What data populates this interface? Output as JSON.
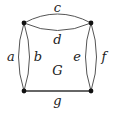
{
  "graph": {
    "name": "G",
    "vertices": [
      {
        "id": "v1",
        "x": 24,
        "y": 23
      },
      {
        "id": "v2",
        "x": 91,
        "y": 23
      },
      {
        "id": "v3",
        "x": 24,
        "y": 91
      },
      {
        "id": "v4",
        "x": 91,
        "y": 91
      }
    ],
    "edges": [
      {
        "label": "a",
        "from": "v1",
        "to": "v3"
      },
      {
        "label": "b",
        "from": "v1",
        "to": "v3"
      },
      {
        "label": "c",
        "from": "v1",
        "to": "v2"
      },
      {
        "label": "d",
        "from": "v1",
        "to": "v2"
      },
      {
        "label": "e",
        "from": "v2",
        "to": "v4"
      },
      {
        "label": "f",
        "from": "v2",
        "to": "v4"
      },
      {
        "label": "g",
        "from": "v3",
        "to": "v4"
      }
    ],
    "labels": {
      "a": "a",
      "b": "b",
      "c": "c",
      "d": "d",
      "e": "e",
      "f": "f",
      "g": "g",
      "G": "G"
    },
    "colors": {
      "edge": "#555555",
      "vertex": "#111111",
      "text": "#222222"
    }
  }
}
